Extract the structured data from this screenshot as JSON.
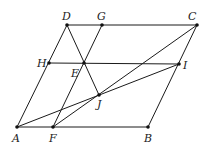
{
  "diagram": {
    "type": "geometry",
    "points": {
      "A": {
        "x": 17,
        "y": 127,
        "label": "A",
        "lx": 12,
        "ly": 142
      },
      "F": {
        "x": 53,
        "y": 127,
        "label": "F",
        "lx": 49,
        "ly": 142
      },
      "B": {
        "x": 148,
        "y": 127,
        "label": "B",
        "lx": 144,
        "ly": 142
      },
      "C": {
        "x": 197,
        "y": 25,
        "label": "C",
        "lx": 188,
        "ly": 20
      },
      "D": {
        "x": 67,
        "y": 25,
        "label": "D",
        "lx": 62,
        "ly": 20
      },
      "G": {
        "x": 102,
        "y": 25,
        "label": "G",
        "lx": 97,
        "ly": 20
      },
      "H": {
        "x": 49,
        "y": 63,
        "label": "H",
        "lx": 37,
        "ly": 67
      },
      "E": {
        "x": 84,
        "y": 63,
        "label": "E",
        "lx": 71,
        "ly": 77
      },
      "I": {
        "x": 179,
        "y": 64,
        "label": "I",
        "lx": 183,
        "ly": 69
      },
      "J": {
        "x": 99,
        "y": 95,
        "label": "J",
        "lx": 97,
        "ly": 108
      }
    },
    "segments": [
      [
        "A",
        "B"
      ],
      [
        "B",
        "C"
      ],
      [
        "C",
        "D"
      ],
      [
        "D",
        "A"
      ],
      [
        "H",
        "I"
      ],
      [
        "F",
        "G"
      ],
      [
        "D",
        "J"
      ],
      [
        "A",
        "I"
      ],
      [
        "F",
        "C"
      ]
    ]
  }
}
